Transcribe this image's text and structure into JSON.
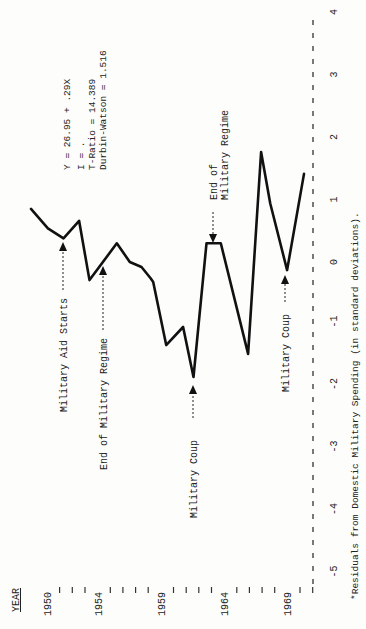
{
  "chart_data": {
    "type": "line",
    "title": "",
    "xlabel": "YEAR",
    "ylabel": "*Residuals from Domestic Military Spending (in standard deviations).",
    "orientation": "rotated-90-ccw",
    "x_tick_labels": [
      "1950",
      "1954",
      "1959",
      "1964",
      "1969"
    ],
    "x_range": [
      1950,
      1971
    ],
    "y_tick_labels": [
      "-5",
      "-4",
      "-3",
      "-2",
      "-1",
      "0",
      "1",
      "2",
      "3",
      "4"
    ],
    "ylim": [
      -5,
      4
    ],
    "grid": false,
    "points": [
      {
        "x": 1950.0,
        "y": 0.85
      },
      {
        "x": 1951.3,
        "y": 0.54
      },
      {
        "x": 1952.5,
        "y": 0.38
      },
      {
        "x": 1953.7,
        "y": 0.66
      },
      {
        "x": 1954.5,
        "y": -0.29
      },
      {
        "x": 1956.6,
        "y": 0.3
      },
      {
        "x": 1957.6,
        "y": 0.0
      },
      {
        "x": 1958.5,
        "y": -0.08
      },
      {
        "x": 1959.2,
        "y": -0.26
      },
      {
        "x": 1959.4,
        "y": -0.32
      },
      {
        "x": 1960.4,
        "y": -1.33
      },
      {
        "x": 1961.7,
        "y": -1.04
      },
      {
        "x": 1962.5,
        "y": -1.84
      },
      {
        "x": 1963.5,
        "y": 0.3
      },
      {
        "x": 1964.6,
        "y": 0.3
      },
      {
        "x": 1966.7,
        "y": -1.47
      },
      {
        "x": 1967.7,
        "y": 1.76
      },
      {
        "x": 1968.4,
        "y": 0.94
      },
      {
        "x": 1969.7,
        "y": -0.13
      },
      {
        "x": 1971.0,
        "y": 1.41
      }
    ],
    "regression": {
      "equation": "Y = 26.95 + .29X",
      "r_line": "I = .",
      "t_ratio": "T-Ratio = 14.389",
      "durbin_watson": "Durbin-Watson = 1.516"
    },
    "annotations": [
      {
        "text": "Military Aid Starts",
        "x": 1952.5,
        "y": 0.38,
        "arrow": "up"
      },
      {
        "text": "End of Military Regime",
        "x": 1955.6,
        "y": 0.0,
        "arrow": "up"
      },
      {
        "text": "Military Coup",
        "x": 1962.5,
        "y": -1.84,
        "arrow": "up"
      },
      {
        "text": "End of Military Regime",
        "x": 1963.9,
        "y": 0.3,
        "arrow": "down"
      },
      {
        "text": "Military Coup",
        "x": 1969.7,
        "y": -0.13,
        "arrow": "up"
      }
    ]
  },
  "labels": {
    "year_header": "YEAR",
    "years": [
      "1950",
      "1954",
      "1959",
      "1964",
      "1969"
    ],
    "caption": "*Residuals from Domestic Military Spending (in standard deviations).",
    "stats": [
      "Y = 26.95 + .29X",
      "I = .",
      "T-Ratio = 14.389",
      "Durbin-Watson = 1.516"
    ],
    "ann_aid": "Military Aid Starts",
    "ann_end1": "End of Military Regime",
    "ann_coup1": "Military Coup",
    "ann_end2a": "End of",
    "ann_end2b": "Military Regime",
    "ann_coup2": "Military Coup"
  }
}
